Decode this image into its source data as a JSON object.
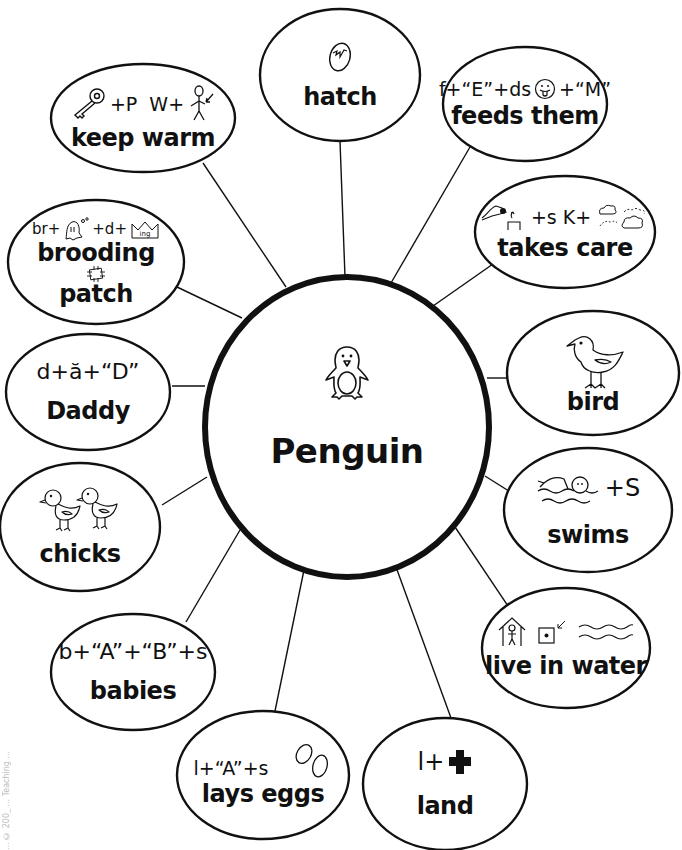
{
  "diagram": {
    "type": "concept-web",
    "center": {
      "label": "Penguin",
      "icon": "penguin-icon",
      "cx": 347,
      "cy": 427,
      "rx": 142,
      "ry": 150
    },
    "nodes": [
      {
        "id": "hatch",
        "label": "hatch",
        "rebus": "",
        "icons": [
          "cracked-egg-icon"
        ],
        "cx": 340,
        "cy": 75,
        "rx": 80,
        "ry": 66,
        "line": [
          [
            340,
            141
          ],
          [
            345,
            277
          ]
        ]
      },
      {
        "id": "keep-warm",
        "label": "keep warm",
        "rebus": "+P  W+",
        "icons": [
          "key-icon",
          "stick-figure-pointing-icon"
        ],
        "cx": 143,
        "cy": 118,
        "rx": 92,
        "ry": 54,
        "line": [
          [
            203,
            163
          ],
          [
            286,
            287
          ]
        ]
      },
      {
        "id": "feeds-them",
        "label": "feeds them",
        "rebus": "f+“E”+ds  +“M”",
        "icons": [
          "tongue-face-icon"
        ],
        "cx": 525,
        "cy": 104,
        "rx": 82,
        "ry": 57,
        "line": [
          [
            470,
            147
          ],
          [
            391,
            283
          ]
        ]
      },
      {
        "id": "takes-care",
        "label": "takes care",
        "rebus": "+s K+",
        "icons": [
          "hand-take-icon",
          "clouds-icon"
        ],
        "cx": 565,
        "cy": 232,
        "rx": 90,
        "ry": 56,
        "line": [
          [
            503,
            257
          ],
          [
            433,
            306
          ]
        ]
      },
      {
        "id": "brooding",
        "label": "brooding",
        "label2": "patch",
        "rebus": "br+  +d+",
        "icons": [
          "ghost-icon",
          "crown-ing-icon",
          "patch-icon"
        ],
        "cx": 96,
        "cy": 262,
        "rx": 88,
        "ry": 62,
        "line": [
          [
            177,
            287
          ],
          [
            242,
            318
          ]
        ]
      },
      {
        "id": "bird",
        "label": "bird",
        "rebus": "",
        "icons": [
          "bird-icon"
        ],
        "cx": 593,
        "cy": 373,
        "rx": 86,
        "ry": 62,
        "line": [
          [
            508,
            378
          ],
          [
            487,
            378
          ]
        ]
      },
      {
        "id": "daddy",
        "label": "Daddy",
        "rebus": "d+ă+“D”",
        "icons": [],
        "cx": 88,
        "cy": 392,
        "rx": 82,
        "ry": 58,
        "line": [
          [
            172,
            386
          ],
          [
            205,
            386
          ]
        ]
      },
      {
        "id": "swims",
        "label": "swims",
        "rebus": "+S",
        "icons": [
          "swimmer-icon"
        ],
        "cx": 588,
        "cy": 510,
        "rx": 84,
        "ry": 62,
        "line": [
          [
            512,
            493
          ],
          [
            485,
            476
          ]
        ]
      },
      {
        "id": "chicks",
        "label": "chicks",
        "rebus": "",
        "icons": [
          "two-chicks-icon"
        ],
        "cx": 80,
        "cy": 527,
        "rx": 80,
        "ry": 64,
        "line": [
          [
            162,
            505
          ],
          [
            207,
            477
          ]
        ]
      },
      {
        "id": "live-in-water",
        "label": "live in water",
        "rebus": "",
        "icons": [
          "house-person-icon",
          "square-dot-icon",
          "water-waves-icon"
        ],
        "cx": 566,
        "cy": 648,
        "rx": 84,
        "ry": 60,
        "line": [
          [
            512,
            612
          ],
          [
            455,
            527
          ]
        ]
      },
      {
        "id": "babies",
        "label": "babies",
        "rebus": "b+“A”+“B”+s",
        "icons": [],
        "cx": 133,
        "cy": 672,
        "rx": 82,
        "ry": 58,
        "line": [
          [
            186,
            622
          ],
          [
            240,
            530
          ]
        ]
      },
      {
        "id": "lays-eggs",
        "label": "lays eggs",
        "rebus": "l+“A”+s",
        "icons": [
          "two-eggs-icon"
        ],
        "cx": 263,
        "cy": 775,
        "rx": 86,
        "ry": 64,
        "line": [
          [
            275,
            711
          ],
          [
            304,
            570
          ]
        ]
      },
      {
        "id": "land",
        "label": "land",
        "rebus": "l+",
        "icons": [
          "bold-plus-icon"
        ],
        "cx": 445,
        "cy": 784,
        "rx": 82,
        "ry": 66,
        "line": [
          [
            451,
            718
          ],
          [
            396,
            567
          ]
        ]
      }
    ],
    "colors": {
      "stroke": "#111111",
      "background": "#ffffff"
    },
    "margin_note": "... © 200_ ... Teaching ..."
  }
}
